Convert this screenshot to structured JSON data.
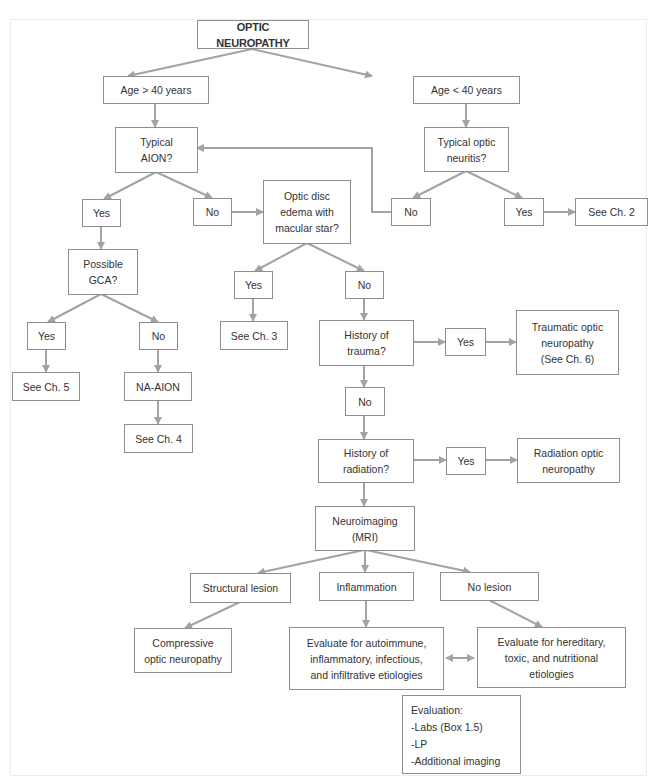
{
  "diagram": {
    "type": "flowchart",
    "title": "OPTIC NEUROPATHY",
    "colors": {
      "box_border": "#8e8e8e",
      "arrow": "#a3a3a3",
      "text": "#333333",
      "background": "#ffffff"
    },
    "nodes": {
      "root": "OPTIC NEUROPATHY",
      "age_over_40": "Age > 40 years",
      "age_under_40": "Age < 40 years",
      "typical_aion": "Typical\nAION?",
      "typical_optic_neuritis": "Typical optic\nneuritis?",
      "aion_yes": "Yes",
      "aion_no": "No",
      "optic_disc_edema": "Optic disc\nedema with\nmacular star?",
      "neuritis_no": "No",
      "neuritis_yes": "Yes",
      "see_ch2": "See Ch. 2",
      "possible_gca": "Possible\nGCA?",
      "edema_yes": "Yes",
      "edema_no": "No",
      "see_ch3": "See Ch. 3",
      "gca_yes": "Yes",
      "gca_no": "No",
      "see_ch5": "See Ch. 5",
      "na_aion": "NA-AION",
      "see_ch4": "See Ch. 4",
      "history_trauma": "History of\ntrauma?",
      "trauma_yes": "Yes",
      "traumatic_optic_neuropathy": "Traumatic optic\nneuropathy\n(See Ch. 6)",
      "trauma_no": "No",
      "history_radiation": "History of\nradiation?",
      "radiation_yes": "Yes",
      "radiation_optic_neuropathy": "Radiation optic\nneuropathy",
      "neuroimaging": "Neuroimaging\n(MRI)",
      "structural_lesion": "Structural lesion",
      "inflammation": "Inflammation",
      "no_lesion": "No lesion",
      "compressive": "Compressive\noptic neuropathy",
      "evaluate_autoimmune": "Evaluate for autoimmune,\ninflammatory, infectious,\nand infiltrative etiologies",
      "evaluate_hereditary": "Evaluate for hereditary,\ntoxic, and nutritional\netiologies",
      "evaluation_list": "Evaluation:\n-Labs (Box 1.5)\n-LP\n-Additional imaging"
    },
    "edges": [
      [
        "root",
        "age_over_40"
      ],
      [
        "root",
        "age_under_40"
      ],
      [
        "age_over_40",
        "typical_aion"
      ],
      [
        "age_under_40",
        "typical_optic_neuritis"
      ],
      [
        "typical_aion",
        "aion_yes"
      ],
      [
        "typical_aion",
        "aion_no"
      ],
      [
        "aion_no",
        "optic_disc_edema"
      ],
      [
        "typical_optic_neuritis",
        "neuritis_no"
      ],
      [
        "typical_optic_neuritis",
        "neuritis_yes"
      ],
      [
        "neuritis_no",
        "typical_aion"
      ],
      [
        "neuritis_yes",
        "see_ch2"
      ],
      [
        "aion_yes",
        "possible_gca"
      ],
      [
        "optic_disc_edema",
        "edema_yes"
      ],
      [
        "optic_disc_edema",
        "edema_no"
      ],
      [
        "edema_yes",
        "see_ch3"
      ],
      [
        "edema_no",
        "history_trauma"
      ],
      [
        "possible_gca",
        "gca_yes"
      ],
      [
        "possible_gca",
        "gca_no"
      ],
      [
        "gca_yes",
        "see_ch5"
      ],
      [
        "gca_no",
        "na_aion"
      ],
      [
        "na_aion",
        "see_ch4"
      ],
      [
        "history_trauma",
        "trauma_yes"
      ],
      [
        "trauma_yes",
        "traumatic_optic_neuropathy"
      ],
      [
        "history_trauma",
        "trauma_no"
      ],
      [
        "trauma_no",
        "history_radiation"
      ],
      [
        "history_radiation",
        "radiation_yes"
      ],
      [
        "radiation_yes",
        "radiation_optic_neuropathy"
      ],
      [
        "history_radiation",
        "neuroimaging"
      ],
      [
        "neuroimaging",
        "structural_lesion"
      ],
      [
        "neuroimaging",
        "inflammation"
      ],
      [
        "neuroimaging",
        "no_lesion"
      ],
      [
        "structural_lesion",
        "compressive"
      ],
      [
        "inflammation",
        "evaluate_autoimmune"
      ],
      [
        "no_lesion",
        "evaluate_hereditary"
      ],
      [
        "evaluate_autoimmune",
        "evaluate_hereditary",
        "bidirectional"
      ]
    ]
  }
}
